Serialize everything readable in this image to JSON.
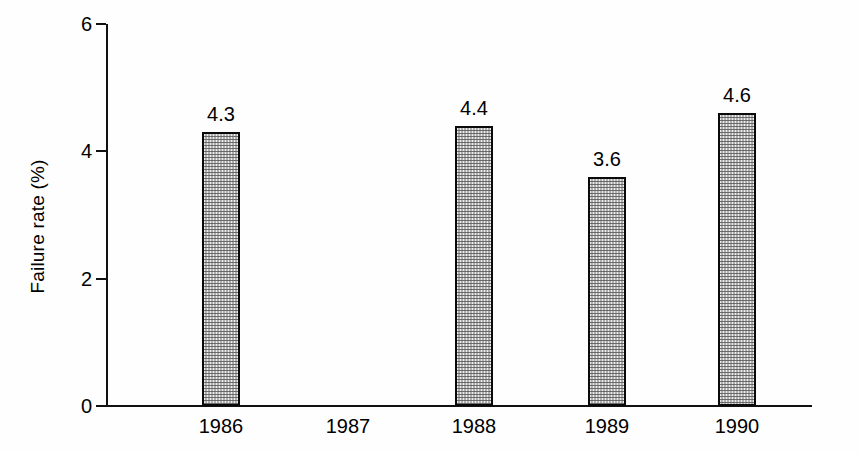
{
  "chart_data": {
    "type": "bar",
    "title": "",
    "subtitle": "",
    "xlabel": "",
    "ylabel": "Failure rate (%)",
    "categories": [
      "1986",
      "1987",
      "1988",
      "1989",
      "1990"
    ],
    "values": [
      4.3,
      null,
      4.4,
      3.6,
      4.6
    ],
    "value_labels": [
      "4.3",
      "",
      "4.4",
      "3.6",
      "4.6"
    ],
    "ylim": [
      0,
      6
    ],
    "ytick_labels": [
      "0",
      "2",
      "4",
      "6"
    ],
    "ytick_values": [
      0,
      2,
      4,
      6
    ],
    "grid": false,
    "legend": false,
    "series": [
      {
        "name": "Failure rate",
        "values": [
          4.3,
          null,
          4.4,
          3.6,
          4.6
        ]
      }
    ],
    "colors": {
      "bar_fill": "#ececec",
      "bar_stipple": "#5a5a5a",
      "bar_outline": "#0a0a0a",
      "axis": "#111111",
      "text": "#000000",
      "background": "#fefefe"
    }
  }
}
